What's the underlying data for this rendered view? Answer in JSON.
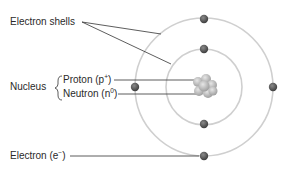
{
  "diagram": {
    "labels": {
      "electron_shells": "Electron shells",
      "nucleus": "Nucleus",
      "proton": "Proton (p",
      "proton_sup": "+",
      "proton_close": ")",
      "neutron": "Neutron (n",
      "neutron_sup": "0",
      "neutron_close": ")",
      "electron": "Electron (e",
      "electron_sup": "−",
      "electron_close": ")"
    },
    "colors": {
      "shell": "#c8c8c8",
      "electron": "#555555",
      "leader": "#333333",
      "nucleus": "#b5b5b5"
    },
    "shells": [
      {
        "name": "inner",
        "radius": 38,
        "electrons": 2
      },
      {
        "name": "outer",
        "radius": 69,
        "electrons": 4
      }
    ]
  }
}
